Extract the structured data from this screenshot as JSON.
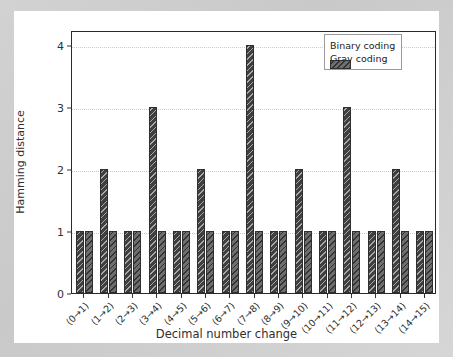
{
  "chart_data": {
    "type": "bar",
    "title": "",
    "xlabel": "Decimal number change",
    "ylabel": "Hamming distance",
    "categories": [
      "(0→1)",
      "(1→2)",
      "(2→3)",
      "(3→4)",
      "(4→5)",
      "(5→6)",
      "(6→7)",
      "(7→8)",
      "(8→9)",
      "(9→10)",
      "(10→11)",
      "(11→12)",
      "(12→13)",
      "(13→14)",
      "(14→15)"
    ],
    "series": [
      {
        "name": "Binary coding",
        "color": "#3f3f3f",
        "hatch": "backslash",
        "values": [
          1,
          2,
          1,
          3,
          1,
          2,
          1,
          4,
          1,
          2,
          1,
          3,
          1,
          2,
          1
        ]
      },
      {
        "name": "Gray coding",
        "color": "#6e6e6e",
        "hatch": "backslash",
        "values": [
          1,
          1,
          1,
          1,
          1,
          1,
          1,
          1,
          1,
          1,
          1,
          1,
          1,
          1,
          1
        ]
      }
    ],
    "yticks": [
      0,
      1,
      2,
      3,
      4
    ],
    "ytick_labels": [
      "0",
      "1",
      "2",
      "3",
      "4"
    ],
    "ylim": [
      0,
      4.25
    ],
    "grid": true,
    "grid_axis": "y",
    "legend_position": "upper right"
  },
  "legend": {
    "entries": [
      {
        "label": "Binary coding"
      },
      {
        "label": "Gray coding"
      }
    ]
  },
  "figure": {
    "background": "#ffffff",
    "mount_background": "#d0d0d0",
    "axes_edge_color": "#2b2b2b",
    "grid_color": "#cbcbcb"
  }
}
